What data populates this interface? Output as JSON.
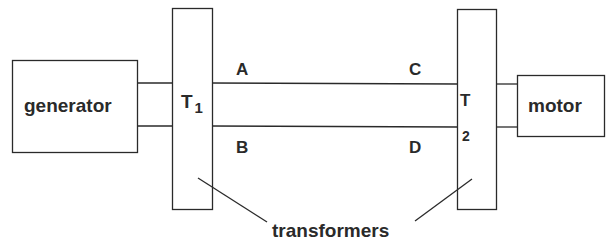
{
  "diagram": {
    "title": "",
    "nodes": {
      "generator": {
        "label": "generator"
      },
      "transformer1": {
        "label": "T",
        "subscript": "1"
      },
      "transformer2": {
        "label": "T",
        "subscript": "2"
      },
      "motor": {
        "label": "motor"
      }
    },
    "line_labels": {
      "a": "A",
      "b": "B",
      "c": "C",
      "d": "D"
    },
    "annotation": {
      "text": "transformers"
    },
    "colors": {
      "stroke": "#2a2a2a",
      "background": "#ffffff"
    }
  }
}
